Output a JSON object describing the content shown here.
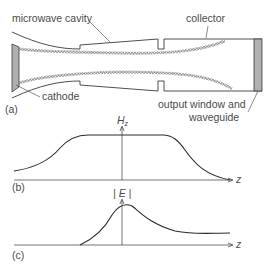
{
  "panel_a": {
    "tag": "(a)",
    "labels": {
      "microwave_cavity": "microwave cavity",
      "collector": "collector",
      "cathode": "cathode",
      "output_window_line1": "output window and",
      "output_window_line2": "waveguide"
    }
  },
  "panel_b": {
    "tag": "(b)",
    "y_axis_label": "H",
    "y_axis_sub": "z",
    "x_axis_label": "z"
  },
  "panel_c": {
    "tag": "(c)",
    "y_axis_label": "| E |",
    "x_axis_label": "z"
  },
  "colors": {
    "line": "#3a3a3a",
    "fill_gray": "#b0b0b0",
    "text": "#4a4a4a"
  }
}
